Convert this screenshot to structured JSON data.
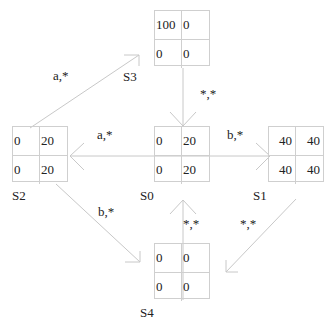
{
  "states": {
    "S0": {
      "label": "S0",
      "values": [
        "0",
        "20",
        "0",
        "20"
      ]
    },
    "S1": {
      "label": "S1",
      "values": [
        "40",
        "40",
        "40",
        "40"
      ]
    },
    "S2": {
      "label": "S2",
      "values": [
        "0",
        "20",
        "0",
        "20"
      ]
    },
    "S3": {
      "label": "S3",
      "values": [
        "100",
        "0",
        "0",
        "0"
      ]
    },
    "S4": {
      "label": "S4",
      "values": [
        "0",
        "0",
        "0",
        "0"
      ]
    }
  },
  "edges": [
    {
      "from": "S0",
      "to": "S2",
      "label": "a,*"
    },
    {
      "from": "S0",
      "to": "S1",
      "label": "b,*"
    },
    {
      "from": "S2",
      "to": "S3",
      "label": "a,*"
    },
    {
      "from": "S2",
      "to": "S4",
      "label": "b,*"
    },
    {
      "from": "S3",
      "to": "S0",
      "label": "*,*"
    },
    {
      "from": "S4",
      "to": "S0",
      "label": "*,*"
    },
    {
      "from": "S1",
      "to": "S4",
      "label": "*,*"
    }
  ]
}
